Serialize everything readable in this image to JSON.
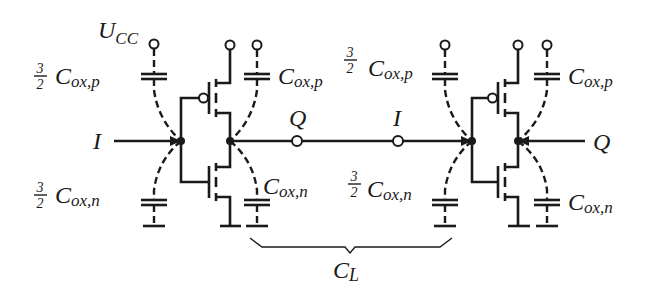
{
  "figure": {
    "colors": {
      "ink": "#1a1a1a",
      "background": "#ffffff"
    }
  },
  "labels": {
    "supply": {
      "main": "U",
      "sub": "CC"
    },
    "input_left": "I",
    "output_mid": "Q",
    "input_mid": "I",
    "output_right": "Q",
    "load": {
      "main": "C",
      "sub": "L"
    },
    "fraction": {
      "num": "3",
      "den": "2"
    },
    "cap_p": {
      "main": "C",
      "sub": "ox,p"
    },
    "cap_n": {
      "main": "C",
      "sub": "ox,n"
    }
  },
  "inverters": [
    {
      "name": "inverter-1",
      "gate_cap_p": "3/2 C_ox,p",
      "gate_cap_n": "3/2 C_ox,n",
      "drain_cap_p": "C_ox,p",
      "drain_cap_n": "C_ox,n"
    },
    {
      "name": "inverter-2",
      "gate_cap_p": "3/2 C_ox,p",
      "gate_cap_n": "3/2 C_ox,n",
      "drain_cap_p": "C_ox,p",
      "drain_cap_n": "C_ox,n"
    }
  ]
}
